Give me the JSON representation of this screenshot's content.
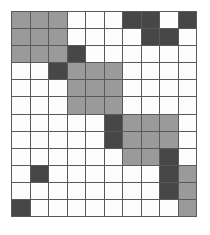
{
  "figure": {
    "type": "grid-pattern",
    "title": "",
    "rows": 12,
    "columns": 10,
    "cell_width_px": 18.6,
    "cell_height_px": 17.2,
    "grid_left_px": 11,
    "grid_top_px": 11,
    "grid_width_px": 186,
    "grid_height_px": 206,
    "gridline_color": "#5a5a5a",
    "gridline_width_px": 1.5,
    "background_color": "#ffffff",
    "legend": [
      {
        "key": "white",
        "label": "empty",
        "color": "#fdfdfd"
      },
      {
        "key": "gray",
        "label": "light-shaded",
        "color": "#9a9a9a"
      },
      {
        "key": "dark",
        "label": "dark-shaded",
        "color": "#474747"
      }
    ],
    "cells": [
      [
        "gray",
        "gray",
        "gray",
        "white",
        "white",
        "white",
        "dark",
        "dark",
        "white",
        "dark"
      ],
      [
        "gray",
        "gray",
        "gray",
        "white",
        "white",
        "white",
        "white",
        "dark",
        "dark",
        "white"
      ],
      [
        "gray",
        "gray",
        "gray",
        "dark",
        "white",
        "white",
        "white",
        "white",
        "white",
        "white"
      ],
      [
        "white",
        "white",
        "dark",
        "gray",
        "gray",
        "gray",
        "white",
        "white",
        "white",
        "white"
      ],
      [
        "white",
        "white",
        "white",
        "gray",
        "gray",
        "gray",
        "white",
        "white",
        "white",
        "white"
      ],
      [
        "white",
        "white",
        "white",
        "gray",
        "gray",
        "gray",
        "white",
        "white",
        "white",
        "white"
      ],
      [
        "white",
        "white",
        "white",
        "white",
        "white",
        "dark",
        "gray",
        "gray",
        "gray",
        "white"
      ],
      [
        "white",
        "white",
        "white",
        "white",
        "white",
        "dark",
        "gray",
        "gray",
        "gray",
        "white"
      ],
      [
        "white",
        "white",
        "white",
        "white",
        "white",
        "white",
        "gray",
        "gray",
        "dark",
        "white"
      ],
      [
        "white",
        "dark",
        "white",
        "white",
        "white",
        "white",
        "white",
        "white",
        "dark",
        "gray"
      ],
      [
        "white",
        "white",
        "white",
        "white",
        "white",
        "white",
        "white",
        "white",
        "dark",
        "gray"
      ],
      [
        "dark",
        "white",
        "white",
        "white",
        "white",
        "white",
        "white",
        "white",
        "white",
        "gray"
      ]
    ],
    "counts": {
      "white": 77,
      "gray": 30,
      "dark": 13,
      "total": 120
    }
  }
}
